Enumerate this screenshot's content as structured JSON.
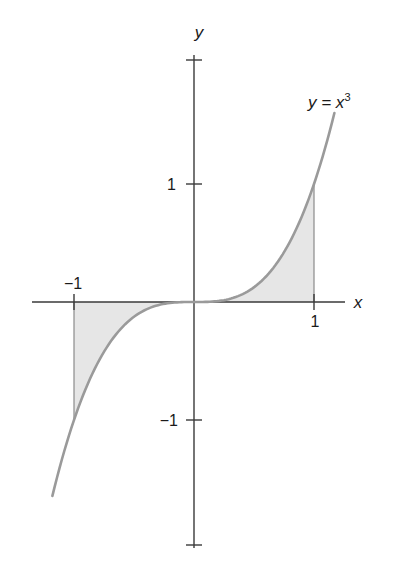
{
  "chart_data": {
    "type": "line",
    "title": "",
    "function": "y = x^3",
    "curve_label": "y = x",
    "curve_label_exponent": "3",
    "xlabel": "x",
    "ylabel": "y",
    "x_ticks": [
      {
        "value": -1,
        "label": "−1"
      },
      {
        "value": 1,
        "label": "1"
      }
    ],
    "y_ticks": [
      {
        "value": 1,
        "label": "1"
      },
      {
        "value": -1,
        "label": "−1"
      }
    ],
    "xlim": [
      -1.35,
      1.26
    ],
    "ylim": [
      -2.05,
      2.05
    ],
    "x_domain_plotted": [
      -1.18,
      1.17
    ],
    "shaded_region": {
      "from_x": -1,
      "to_x": 1,
      "between": "curve and x-axis"
    },
    "grid": false,
    "legend": "none",
    "series": [
      {
        "name": "y = x^3",
        "x": [
          -1.18,
          -1.0,
          -0.8,
          -0.6,
          -0.4,
          -0.2,
          0,
          0.2,
          0.4,
          0.6,
          0.8,
          1.0,
          1.17
        ],
        "values": [
          -1.643,
          -1.0,
          -0.512,
          -0.216,
          -0.064,
          -0.008,
          0,
          0.008,
          0.064,
          0.216,
          0.512,
          1.0,
          1.602
        ]
      }
    ],
    "colors": {
      "curve": "#9a9a9a",
      "fill": "#e6e6e6",
      "axes": "#3a3a3a",
      "text": "#1a1a1a"
    }
  }
}
